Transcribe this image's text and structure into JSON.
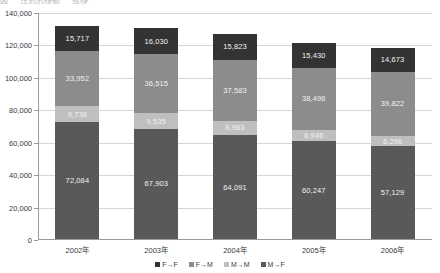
{
  "top_crop_text": [
    "図",
    "性別別移動",
    "推移"
  ],
  "chart_data": {
    "type": "bar",
    "stacked": true,
    "title": "",
    "xlabel": "",
    "ylabel": "",
    "ylim": [
      0,
      140000
    ],
    "ytick_labels": [
      "140,000",
      "120,000",
      "100,000",
      "80,000",
      "60,000",
      "40,000",
      "20,000",
      "0"
    ],
    "ytick_values": [
      140000,
      120000,
      100000,
      80000,
      60000,
      40000,
      20000,
      0
    ],
    "grid": true,
    "legend_position": "bottom",
    "categories": [
      "2002年",
      "2003年",
      "2004年",
      "2005年",
      "2006年"
    ],
    "series": [
      {
        "name": "M→F",
        "color": "#595959",
        "label_color": "light",
        "values": [
          72084,
          67903,
          64091,
          60247,
          57129
        ],
        "labels": [
          "72,084",
          "67,903",
          "64,091",
          "60,247",
          "57,129"
        ]
      },
      {
        "name": "M→M",
        "color": "#bfbfbf",
        "label_color": "light",
        "values": [
          9738,
          9535,
          8983,
          6946,
          6296
        ],
        "labels": [
          "9,738",
          "9,535",
          "8,983",
          "6,946",
          "6,296"
        ]
      },
      {
        "name": "F→M",
        "color": "#8c8c8c",
        "label_color": "light",
        "values": [
          33952,
          36515,
          37583,
          38496,
          39822
        ],
        "labels": [
          "33,952",
          "36,515",
          "37,583",
          "38,496",
          "39,822"
        ]
      },
      {
        "name": "F→F",
        "color": "#333333",
        "label_color": "light",
        "values": [
          15717,
          16030,
          15823,
          15430,
          14673
        ],
        "labels": [
          "15,717",
          "16,030",
          "15,823",
          "15,430",
          "14,673"
        ]
      }
    ],
    "legend_order": [
      "F→F",
      "F→M",
      "M→M",
      "M→F"
    ],
    "legend_colors": [
      "#333333",
      "#8c8c8c",
      "#bfbfbf",
      "#595959"
    ]
  }
}
